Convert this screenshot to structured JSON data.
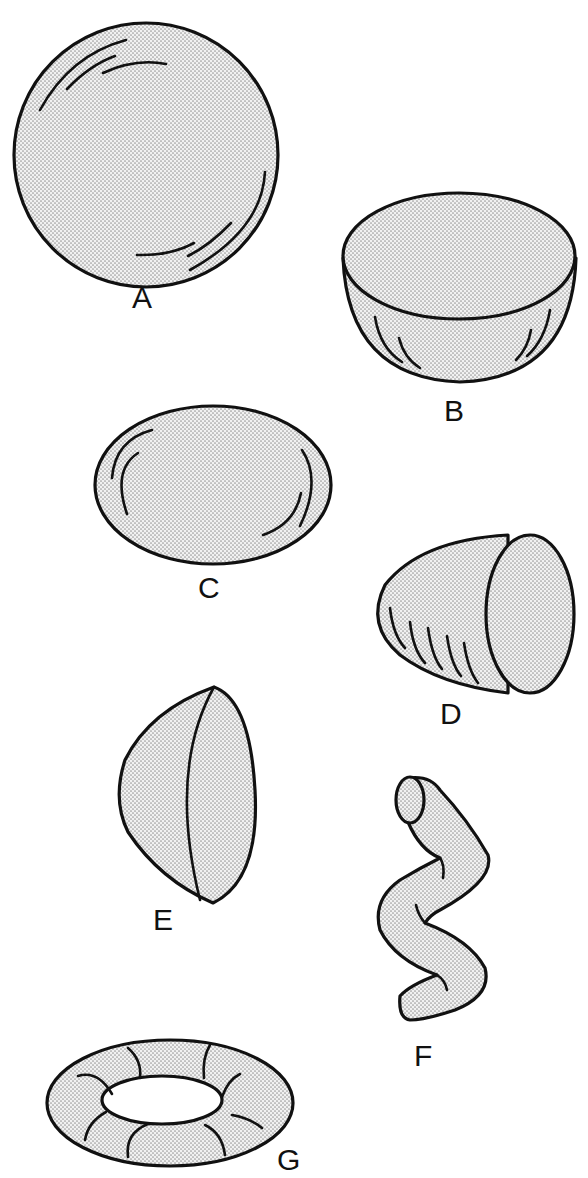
{
  "figure": {
    "style": {
      "stroke": "#111111",
      "fill_pattern": "dot stipple",
      "dot_color": "#9a9a9a",
      "background": "#ffffff"
    },
    "shapes": [
      {
        "id": "A",
        "label": "A",
        "shape": "sphere",
        "position": "top-left"
      },
      {
        "id": "B",
        "label": "B",
        "shape": "hemisphere (bowl, flat face up)",
        "position": "upper-right"
      },
      {
        "id": "C",
        "label": "C",
        "shape": "oblate ellipsoid / flattened disc",
        "position": "middle-left"
      },
      {
        "id": "D",
        "label": "D",
        "shape": "paraboloid / cone-like cap, open face right",
        "position": "middle-right"
      },
      {
        "id": "E",
        "label": "E",
        "shape": "half-lens / dome cap, flat face right",
        "position": "lower-left"
      },
      {
        "id": "F",
        "label": "F",
        "shape": "coiled / wavy tube",
        "position": "lower-right"
      },
      {
        "id": "G",
        "label": "G",
        "shape": "torus (ring)",
        "position": "bottom-left"
      }
    ]
  }
}
